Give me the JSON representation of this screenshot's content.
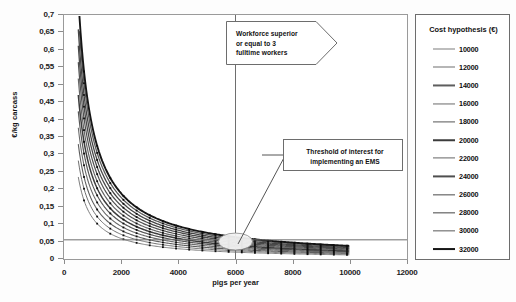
{
  "chart_data": {
    "type": "line",
    "title": "",
    "xlabel": "pigs per year",
    "ylabel": "€/kg carcass",
    "xlim": [
      0,
      12000
    ],
    "ylim": [
      0,
      0.7
    ],
    "grid": false,
    "legend_position": "right",
    "legend_title": "Cost hypothesis (€)",
    "x_ticks": [
      "0",
      "2000",
      "4000",
      "6000",
      "8000",
      "10000",
      "12000"
    ],
    "x_tick_values": [
      0,
      2000,
      4000,
      6000,
      8000,
      10000,
      12000
    ],
    "y_ticks": [
      "0",
      "0,05",
      "0,1",
      "0,15",
      "0,2",
      "0,25",
      "0,3",
      "0,35",
      "0,4",
      "0,45",
      "0,5",
      "0,55",
      "0,6",
      "0,65",
      "0,7"
    ],
    "y_tick_values": [
      0,
      0.05,
      0.1,
      0.15,
      0.2,
      0.25,
      0.3,
      0.35,
      0.4,
      0.45,
      0.5,
      0.55,
      0.6,
      0.65,
      0.7
    ],
    "x_domain": [
      500,
      10000
    ],
    "series": [
      {
        "name": "10000",
        "cost": 10000,
        "width": 1.0,
        "color": "#7d7d7d"
      },
      {
        "name": "12000",
        "cost": 12000,
        "width": 1.0,
        "color": "#6f6f6f"
      },
      {
        "name": "14000",
        "cost": 14000,
        "width": 1.1,
        "color": "#5e5e5e"
      },
      {
        "name": "16000",
        "cost": 16000,
        "width": 1.1,
        "color": "#6a6a6a"
      },
      {
        "name": "18000",
        "cost": 18000,
        "width": 1.2,
        "color": "#575757"
      },
      {
        "name": "20000",
        "cost": 20000,
        "width": 1.5,
        "color": "#3c3c3c"
      },
      {
        "name": "22000",
        "cost": 22000,
        "width": 1.2,
        "color": "#656565"
      },
      {
        "name": "24000",
        "cost": 24000,
        "width": 1.2,
        "color": "#4f4f4f"
      },
      {
        "name": "26000",
        "cost": 26000,
        "width": 1.3,
        "color": "#4a4a4a"
      },
      {
        "name": "28000",
        "cost": 28000,
        "width": 1.3,
        "color": "#444444"
      },
      {
        "name": "30000",
        "cost": 30000,
        "width": 1.3,
        "color": "#5a5a5a"
      },
      {
        "name": "32000",
        "cost": 32000,
        "width": 1.9,
        "color": "#161616"
      }
    ],
    "reference_lines": [
      {
        "name": "workforce-vertical-line",
        "orientation": "vertical",
        "value": 6000
      },
      {
        "name": "ems-threshold-line",
        "orientation": "horizontal",
        "value": 0.055
      }
    ],
    "highlight_ellipse": {
      "x": 6000,
      "y": 0.05
    },
    "annotations": [
      {
        "name": "workforce-callout",
        "text": "Workforce superior or equal to 3 fulltime workers",
        "shape": "arrow-right"
      },
      {
        "name": "ems-threshold-callout",
        "text": "Threshold of interest for implementing an EMS",
        "shape": "rectangle"
      }
    ],
    "curve_note": "cost per kg carcass = annual cost hypothesis / (pigs per year * 85 kg carcass)"
  },
  "axes": {
    "y_title": "€/kg carcass",
    "x_title": "pigs per year"
  },
  "legend": {
    "title": "Cost hypothesis (€)",
    "items": [
      "10000",
      "12000",
      "14000",
      "16000",
      "18000",
      "20000",
      "22000",
      "24000",
      "26000",
      "28000",
      "30000",
      "32000"
    ]
  },
  "callouts": {
    "workforce": {
      "line1": "Workforce superior",
      "line2": "or equal to 3",
      "line3": "fulltime workers"
    },
    "threshold": {
      "line1": "Threshold of interest for",
      "line2": "implementing an EMS"
    }
  }
}
